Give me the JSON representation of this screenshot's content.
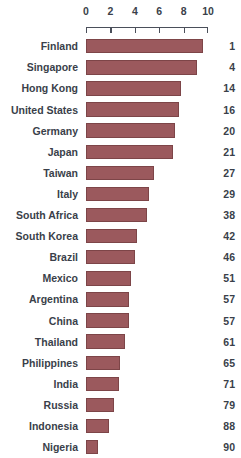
{
  "chart_data": {
    "type": "bar",
    "title": "",
    "subtitle": "",
    "xlabel": "",
    "ylabel": "",
    "orientation": "horizontal",
    "xlim": [
      0,
      10
    ],
    "grid": false,
    "legend": null,
    "axis_position": "top",
    "bar_color": "#9b595d",
    "bar_border_color": "#7d4548",
    "text_color": "#3a3f4a",
    "axis_color": "#4a4f5a",
    "tick_labels": [
      "0",
      "2",
      "4",
      "6",
      "8",
      "10"
    ],
    "ticks": [
      0,
      2,
      4,
      6,
      8,
      10
    ],
    "categories": [
      "Finland",
      "Singapore",
      "Hong Kong",
      "United States",
      "Germany",
      "Japan",
      "Taiwan",
      "Italy",
      "South Africa",
      "South Korea",
      "Brazil",
      "Mexico",
      "Argentina",
      "China",
      "Thailand",
      "Philippines",
      "India",
      "Russia",
      "Indonesia",
      "Nigeria"
    ],
    "values": [
      9.6,
      9.1,
      7.8,
      7.6,
      7.3,
      7.1,
      5.6,
      5.2,
      5.0,
      4.2,
      4.0,
      3.7,
      3.5,
      3.5,
      3.2,
      2.8,
      2.7,
      2.3,
      1.9,
      1.0
    ],
    "data_labels": [
      "1",
      "4",
      "14",
      "16",
      "20",
      "21",
      "27",
      "29",
      "38",
      "42",
      "46",
      "51",
      "57",
      "57",
      "61",
      "65",
      "71",
      "79",
      "88",
      "90"
    ],
    "rows": [
      {
        "label": "Finland",
        "value": 9.6,
        "rank": "1"
      },
      {
        "label": "Singapore",
        "value": 9.1,
        "rank": "4"
      },
      {
        "label": "Hong Kong",
        "value": 7.8,
        "rank": "14"
      },
      {
        "label": "United States",
        "value": 7.6,
        "rank": "16"
      },
      {
        "label": "Germany",
        "value": 7.3,
        "rank": "20"
      },
      {
        "label": "Japan",
        "value": 7.1,
        "rank": "21"
      },
      {
        "label": "Taiwan",
        "value": 5.6,
        "rank": "27"
      },
      {
        "label": "Italy",
        "value": 5.2,
        "rank": "29"
      },
      {
        "label": "South Africa",
        "value": 5.0,
        "rank": "38"
      },
      {
        "label": "South Korea",
        "value": 4.2,
        "rank": "42"
      },
      {
        "label": "Brazil",
        "value": 4.0,
        "rank": "46"
      },
      {
        "label": "Mexico",
        "value": 3.7,
        "rank": "51"
      },
      {
        "label": "Argentina",
        "value": 3.5,
        "rank": "57"
      },
      {
        "label": "China",
        "value": 3.5,
        "rank": "57"
      },
      {
        "label": "Thailand",
        "value": 3.2,
        "rank": "61"
      },
      {
        "label": "Philippines",
        "value": 2.8,
        "rank": "65"
      },
      {
        "label": "India",
        "value": 2.7,
        "rank": "71"
      },
      {
        "label": "Russia",
        "value": 2.3,
        "rank": "79"
      },
      {
        "label": "Indonesia",
        "value": 1.9,
        "rank": "88"
      },
      {
        "label": "Nigeria",
        "value": 1.0,
        "rank": "90"
      }
    ]
  }
}
